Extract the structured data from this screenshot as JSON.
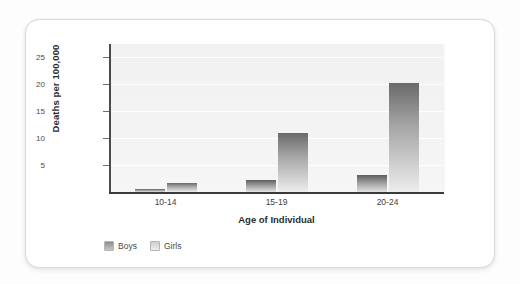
{
  "chart_data": {
    "type": "bar",
    "title": "",
    "xlabel": "Age of Individual",
    "ylabel": "Deaths per 100,000",
    "categories": [
      "10-14",
      "15-19",
      "20-24"
    ],
    "series": [
      {
        "name": "Boys",
        "values": [
          0.5,
          2.2,
          3.2
        ],
        "color": "#8e8e8e"
      },
      {
        "name": "Girls",
        "values": [
          1.6,
          10.9,
          20.3
        ],
        "color": "#cfcfcf"
      }
    ],
    "ylim": [
      0,
      27.5
    ],
    "yticks": [
      5,
      10,
      15,
      20,
      25
    ],
    "ytick_labels": [
      "5",
      "10",
      "15",
      "20",
      "25"
    ],
    "grid": true,
    "legend_position": "bottom-left",
    "plot_background": "#f3f3f3",
    "card_background": "#ffffff"
  },
  "legend": {
    "items": [
      {
        "label": "Boys"
      },
      {
        "label": "Girls"
      }
    ]
  }
}
